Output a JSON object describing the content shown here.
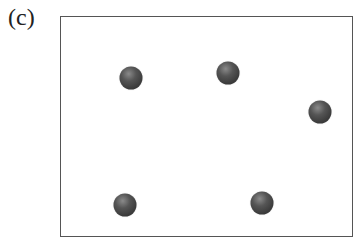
{
  "panel": {
    "label": "(c)"
  },
  "frame": {
    "x": 60,
    "y": 16,
    "width": 293,
    "height": 221,
    "border_color": "#555555"
  },
  "spheres": [
    {
      "id": 1,
      "x": 131,
      "y": 78
    },
    {
      "id": 2,
      "x": 228,
      "y": 73
    },
    {
      "id": 3,
      "x": 320,
      "y": 112
    },
    {
      "id": 4,
      "x": 125,
      "y": 205
    },
    {
      "id": 5,
      "x": 262,
      "y": 203
    }
  ],
  "colors": {
    "sphere": "#444444",
    "sphere_highlight": "#8a8a8a",
    "background": "#ffffff"
  }
}
